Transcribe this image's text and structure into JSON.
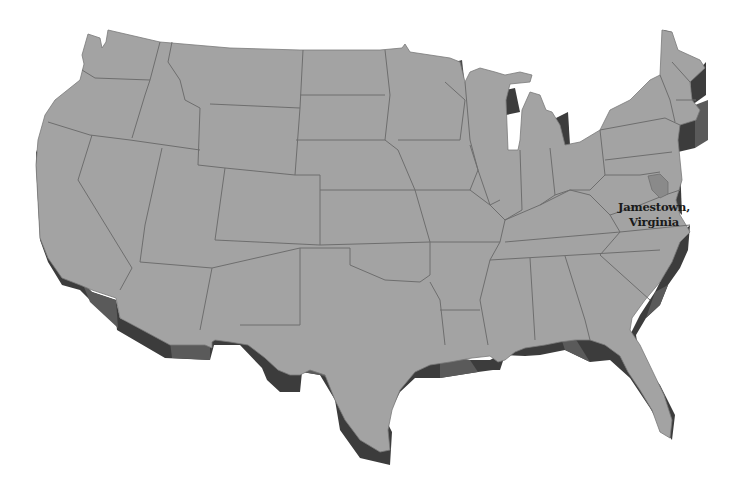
{
  "map": {
    "title": "United States (contiguous) 3D relief map",
    "colors": {
      "background": "#ffffff",
      "land": "#a3a3a3",
      "border": "#6e6e6e",
      "side_dark": "#3c3c3c",
      "side_mid": "#5a5a5a",
      "highlight_state": "#8a8a8a"
    },
    "highlighted_state": "Virginia",
    "label": {
      "line1": "Jamestown,",
      "line2": "Virginia"
    }
  }
}
